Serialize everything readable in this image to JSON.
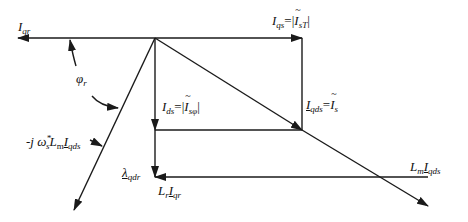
{
  "diagram": {
    "type": "phasor-diagram",
    "colors": {
      "stroke": "#1a1a1a",
      "background": "#ffffff"
    },
    "labels": {
      "i_qr": {
        "base": "I",
        "sub": "qr"
      },
      "i_qs": {
        "base": "I",
        "sub": "qs",
        "eq": "=|",
        "base2": "I",
        "sub2": "sT",
        "end": "|"
      },
      "phi_r": {
        "base": "φ",
        "sub": "r"
      },
      "i_ds": {
        "base": "I",
        "sub": "ds",
        "eq": "=|",
        "base2": "I",
        "sub2": "sφ",
        "end": "|"
      },
      "i_qds": {
        "base": "I",
        "sub": "qds",
        "eq": "=",
        "base2": "I",
        "sub2": "s"
      },
      "neg_j_omega": {
        "prefix": "-j ω",
        "sup": "*",
        "sub": "s",
        "mid": "L",
        "sub_m": "m",
        "base2": "I",
        "sub2": "qds"
      },
      "lambda_qdr": {
        "base": "λ",
        "sub": "qdr"
      },
      "lr_iqr": {
        "base": "L",
        "sub": "r",
        "base2": "I",
        "sub2": "qr"
      },
      "lm_iqds": {
        "base": "L",
        "sub": "m",
        "base2": "I",
        "sub2": "qds"
      }
    }
  }
}
